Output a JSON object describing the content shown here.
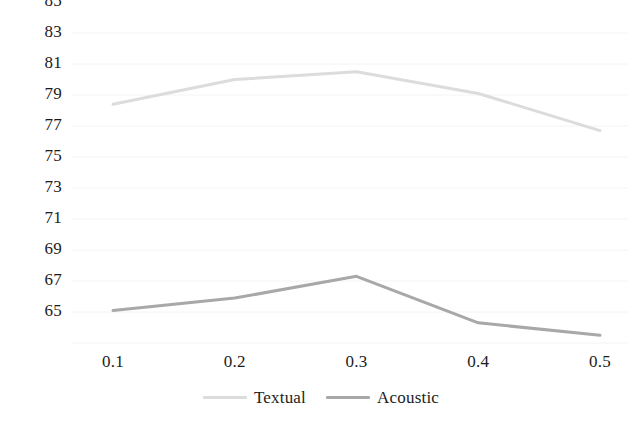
{
  "chart_data": {
    "type": "line",
    "title": "",
    "subtitle": "",
    "xlabel": "",
    "ylabel": "",
    "categories": [
      "0.1",
      "0.2",
      "0.3",
      "0.4",
      "0.5"
    ],
    "x": [
      0.1,
      0.2,
      0.3,
      0.4,
      0.5
    ],
    "series": [
      {
        "name": "Textual",
        "color": "#dcdcdc",
        "values": [
          80.4,
          82.0,
          82.5,
          81.1,
          78.7
        ]
      },
      {
        "name": "Acoustic",
        "color": "#a8a8a8",
        "values": [
          67.1,
          67.9,
          69.3,
          66.3,
          65.5
        ]
      }
    ],
    "ylim": [
      65,
      85
    ],
    "ytick_labels": [
      "85",
      "83",
      "81",
      "79",
      "77",
      "75",
      "73",
      "71",
      "69",
      "67",
      "65"
    ],
    "ytick_values": [
      85,
      83,
      81,
      79,
      77,
      75,
      73,
      71,
      69,
      67,
      65
    ],
    "xtick_labels": [
      "0.1",
      "0.2",
      "0.3",
      "0.4",
      "0.5"
    ],
    "grid": true,
    "grid_color": "#f4f4f4",
    "legend_position": "bottom",
    "background": "#ffffff"
  }
}
